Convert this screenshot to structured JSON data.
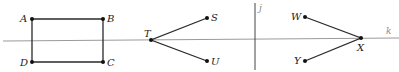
{
  "figure": {
    "width": 399,
    "height": 72,
    "colors": {
      "segment": "#2a2a2a",
      "reference_line_k": "#9a9a9a",
      "reference_line_j": "#444444",
      "point": "#111111",
      "label": "#222222"
    },
    "lines": {
      "k": {
        "label": "k",
        "x1": 3,
        "y1": 41,
        "x2": 399,
        "y2": 38,
        "label_x": 386,
        "label_y": 34
      },
      "j": {
        "label": "j",
        "x1": 255,
        "y1": 3,
        "x2": 255,
        "y2": 70,
        "label_x": 259,
        "label_y": 11
      }
    },
    "points": {
      "A": {
        "label": "A",
        "x": 32,
        "y": 19
      },
      "B": {
        "label": "B",
        "x": 103,
        "y": 19
      },
      "C": {
        "label": "C",
        "x": 103,
        "y": 62
      },
      "D": {
        "label": "D",
        "x": 32,
        "y": 62
      },
      "T": {
        "label": "T",
        "x": 151,
        "y": 40
      },
      "S": {
        "label": "S",
        "x": 207,
        "y": 18
      },
      "U": {
        "label": "U",
        "x": 207,
        "y": 61
      },
      "W": {
        "label": "W",
        "x": 305,
        "y": 17
      },
      "X": {
        "label": "X",
        "x": 361,
        "y": 38
      },
      "Y": {
        "label": "Y",
        "x": 305,
        "y": 61
      }
    },
    "shapes": {
      "rectangle_ABCD": [
        "A",
        "B",
        "C",
        "D"
      ],
      "angle_STU": [
        "S",
        "T",
        "U"
      ],
      "angle_WXY": [
        "W",
        "X",
        "Y"
      ]
    }
  }
}
